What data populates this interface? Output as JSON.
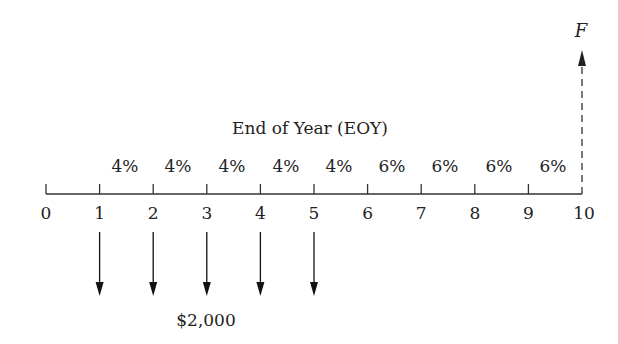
{
  "title": "End of Year (EOY)",
  "future_value_label": "F",
  "payment_label": "$2,000",
  "axis": {
    "ticks": [
      "0",
      "1",
      "2",
      "3",
      "4",
      "5",
      "6",
      "7",
      "8",
      "9",
      "10"
    ]
  },
  "rates": [
    "4%",
    "4%",
    "4%",
    "4%",
    "4%",
    "6%",
    "6%",
    "6%",
    "6%",
    "6%"
  ],
  "payments": {
    "years": [
      1,
      2,
      3,
      4,
      5
    ],
    "amount": "$2,000",
    "direction": "down"
  },
  "future_value": {
    "year": 10,
    "label": "F",
    "direction": "up",
    "style": "dashed"
  }
}
